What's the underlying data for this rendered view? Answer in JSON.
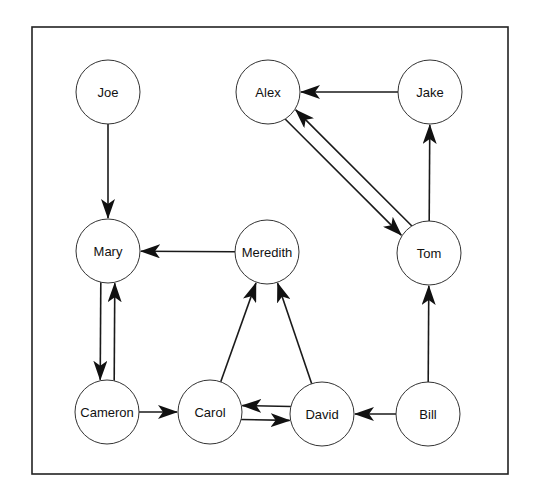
{
  "diagram": {
    "type": "directed-graph",
    "frame": {
      "x": 32,
      "y": 27,
      "width": 476,
      "height": 447
    },
    "node_radius": 32,
    "nodes": [
      {
        "id": "joe",
        "label": "Joe",
        "x": 108,
        "y": 92
      },
      {
        "id": "alex",
        "label": "Alex",
        "x": 268,
        "y": 92
      },
      {
        "id": "jake",
        "label": "Jake",
        "x": 430,
        "y": 92
      },
      {
        "id": "mary",
        "label": "Mary",
        "x": 108,
        "y": 251
      },
      {
        "id": "meredith",
        "label": "Meredith",
        "x": 267,
        "y": 252
      },
      {
        "id": "tom",
        "label": "Tom",
        "x": 429,
        "y": 253
      },
      {
        "id": "cameron",
        "label": "Cameron",
        "x": 107,
        "y": 412
      },
      {
        "id": "carol",
        "label": "Carol",
        "x": 210,
        "y": 412
      },
      {
        "id": "david",
        "label": "David",
        "x": 322,
        "y": 414
      },
      {
        "id": "bill",
        "label": "Bill",
        "x": 428,
        "y": 414
      }
    ],
    "edges": [
      {
        "from": "joe",
        "to": "mary"
      },
      {
        "from": "jake",
        "to": "alex"
      },
      {
        "from": "alex",
        "to": "tom"
      },
      {
        "from": "tom",
        "to": "alex"
      },
      {
        "from": "tom",
        "to": "jake"
      },
      {
        "from": "meredith",
        "to": "mary"
      },
      {
        "from": "mary",
        "to": "cameron"
      },
      {
        "from": "cameron",
        "to": "mary"
      },
      {
        "from": "cameron",
        "to": "carol"
      },
      {
        "from": "carol",
        "to": "meredith"
      },
      {
        "from": "david",
        "to": "meredith"
      },
      {
        "from": "carol",
        "to": "david"
      },
      {
        "from": "david",
        "to": "carol"
      },
      {
        "from": "bill",
        "to": "david"
      },
      {
        "from": "bill",
        "to": "tom"
      }
    ],
    "colors": {
      "stroke": "#1a1a1a",
      "node_fill": "#ffffff",
      "background": "#ffffff"
    }
  }
}
